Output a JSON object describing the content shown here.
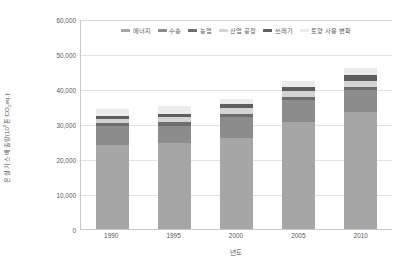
{
  "chart_data": {
    "type": "bar",
    "subtype": "stacked-vertical",
    "title": "",
    "xlabel": "년도",
    "ylabel": "온실 가스 배출량(10⁶톤 CO₂eq.)",
    "ylabel_parts": {
      "prefix": "온실 가스 배출량(10",
      "exp": "6",
      "middle": "톤 CO",
      "sub": "2",
      "suffix": "eq.)"
    },
    "categories": [
      "1990",
      "1995",
      "2000",
      "2005",
      "2010"
    ],
    "ylim": [
      0,
      60000
    ],
    "yticks": [
      0,
      10000,
      20000,
      30000,
      40000,
      50000,
      60000
    ],
    "ytick_labels": [
      "0",
      "10,000",
      "20,000",
      "30,000",
      "40,000",
      "50,000",
      "60,000"
    ],
    "grid": true,
    "legend_position": "top-inside",
    "series": [
      {
        "name": "에너지",
        "color": "#a6a6a6",
        "values": [
          23900,
          24500,
          26100,
          30500,
          33400
        ]
      },
      {
        "name": "수송",
        "color": "#8c8c8c",
        "values": [
          5500,
          5000,
          5800,
          6300,
          6200
        ]
      },
      {
        "name": "농업",
        "color": "#6e6e6e",
        "values": [
          1000,
          1000,
          900,
          900,
          900
        ]
      },
      {
        "name": "산업 공정",
        "color": "#d4d4d4",
        "values": [
          1100,
          1400,
          1700,
          1800,
          1900
        ]
      },
      {
        "name": "쓰레기",
        "color": "#5f5f5f",
        "values": [
          900,
          1000,
          1100,
          1200,
          1600
        ]
      },
      {
        "name": "토양 사용 변화",
        "color": "#ebebeb",
        "values": [
          1800,
          2200,
          1700,
          1700,
          1900
        ]
      }
    ],
    "totals": [
      34200,
      35100,
      37300,
      42400,
      45900
    ]
  },
  "axis_colors": {
    "axis_line": "#c9c9c9",
    "gridline": "#e2e2e2",
    "text": "#58585a"
  },
  "footnote": "",
  "legend": {
    "items": [
      {
        "label": "에너지"
      },
      {
        "label": "수송"
      },
      {
        "label": "농업"
      },
      {
        "label": "산업 공정"
      },
      {
        "label": "쓰레기"
      },
      {
        "label": "토양 사용 변화"
      }
    ]
  }
}
